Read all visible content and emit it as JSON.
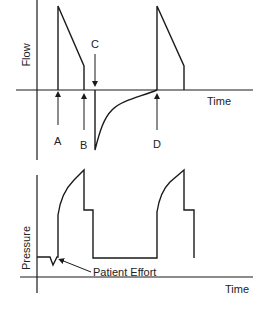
{
  "diagram": {
    "flow_panel": {
      "y_label": "Flow",
      "x_label": "Time",
      "markers": [
        {
          "id": "A",
          "label": "A"
        },
        {
          "id": "B",
          "label": "B"
        },
        {
          "id": "C",
          "label": "C"
        },
        {
          "id": "D",
          "label": "D"
        }
      ]
    },
    "pressure_panel": {
      "y_label": "Pressure",
      "x_label": "Time",
      "annotation": "Patient Effort"
    },
    "colors": {
      "line": "#1a1a1a",
      "background": "#ffffff"
    }
  }
}
